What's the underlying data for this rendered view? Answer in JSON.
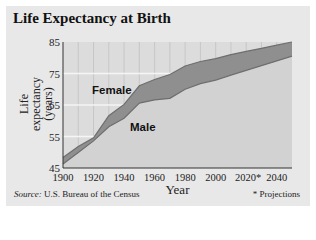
{
  "title": "Life Expectancy at Birth",
  "source_label": "Source:",
  "source_text": " U.S. Bureau of the Census",
  "footnote": "* Projections",
  "series_labels": {
    "female": "Female",
    "male": "Male"
  },
  "colors": {
    "band": "#8f8f8f",
    "line": "#6e6e6e",
    "plot_bg": "#dcdcdc",
    "gridline": "#f5f5f5"
  },
  "chart_data": {
    "type": "area",
    "title": "Life Expectancy at Birth",
    "xlabel": "Year",
    "ylabel": "Life expectancy (years)",
    "x": [
      1900,
      1910,
      1920,
      1930,
      1940,
      1950,
      1960,
      1970,
      1980,
      1990,
      2000,
      2010,
      2020,
      2030,
      2040,
      2050
    ],
    "series": [
      {
        "name": "Female",
        "values": [
          48.3,
          51.8,
          54.6,
          61.6,
          65.2,
          71.1,
          73.1,
          74.7,
          77.4,
          78.8,
          79.7,
          81.0,
          82.0,
          83.0,
          84.0,
          85.0
        ]
      },
      {
        "name": "Male",
        "values": [
          46.3,
          49.9,
          53.6,
          58.1,
          60.8,
          65.6,
          66.6,
          67.1,
          70.0,
          71.8,
          72.9,
          74.5,
          76.0,
          77.5,
          79.0,
          80.5
        ]
      }
    ],
    "x_tick_labels": [
      "1900",
      "1920",
      "1940",
      "1960",
      "1980",
      "2000",
      "2020*",
      "2040"
    ],
    "y_tick_labels": [
      "45",
      "55",
      "65",
      "75",
      "85"
    ],
    "xlim": [
      1900,
      2050
    ],
    "ylim": [
      45,
      85
    ],
    "grid": true,
    "annotations": [
      "Female",
      "Male",
      "* Projections"
    ],
    "note": "Years 2020 and later are projections"
  }
}
